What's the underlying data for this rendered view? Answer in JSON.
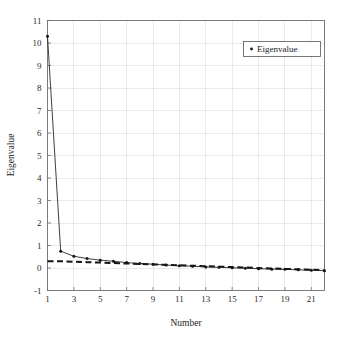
{
  "chart_data": {
    "type": "line",
    "title": "",
    "xlabel": "Number",
    "ylabel": "Eigenvalue",
    "xlim": [
      1,
      22
    ],
    "ylim": [
      -1,
      11
    ],
    "grid": true,
    "legend_position": "top-right",
    "legend_entries": [
      "Eigenvalue"
    ],
    "xticks": [
      1,
      3,
      5,
      7,
      9,
      11,
      13,
      15,
      17,
      19,
      21
    ],
    "xtick_labels": [
      "1",
      "3",
      "5",
      "7",
      "9",
      "11",
      "13",
      "15",
      "17",
      "19",
      "21"
    ],
    "yticks": [
      -1,
      0,
      1,
      2,
      3,
      4,
      5,
      6,
      7,
      8,
      9,
      10,
      11
    ],
    "ytick_labels": [
      "-1",
      "0",
      "1",
      "2",
      "3",
      "4",
      "5",
      "6",
      "7",
      "8",
      "9",
      "10",
      "11"
    ],
    "x": [
      1,
      2,
      3,
      4,
      5,
      6,
      7,
      8,
      9,
      10,
      11,
      12,
      13,
      14,
      15,
      16,
      17,
      18,
      19,
      20,
      21,
      22
    ],
    "series": [
      {
        "name": "Eigenvalue",
        "marker": "dot",
        "values": [
          10.3,
          0.75,
          0.52,
          0.42,
          0.35,
          0.3,
          0.24,
          0.2,
          0.17,
          0.13,
          0.1,
          0.08,
          0.05,
          0.03,
          0.01,
          -0.01,
          -0.03,
          -0.05,
          -0.06,
          -0.08,
          -0.1,
          -0.12
        ]
      },
      {
        "name": "Reference",
        "marker": "none",
        "style": "dashed",
        "values": [
          0.3,
          0.3,
          0.28,
          0.26,
          0.24,
          0.22,
          0.2,
          0.18,
          0.16,
          0.14,
          0.12,
          0.1,
          0.08,
          0.06,
          0.04,
          0.02,
          0.0,
          -0.02,
          -0.04,
          -0.06,
          -0.08,
          -0.1
        ]
      }
    ]
  },
  "legend": {
    "entry_label": "Eigenvalue",
    "marker_symbol": "•"
  },
  "axes": {
    "x_title": "Number",
    "y_title": "Eigenvalue"
  },
  "colors": {
    "series_line": "#1d1d1d",
    "reference_line": "#141414",
    "grid": "#d8d8dc",
    "frame": "#6f6f6f",
    "background": "#ffffff"
  }
}
